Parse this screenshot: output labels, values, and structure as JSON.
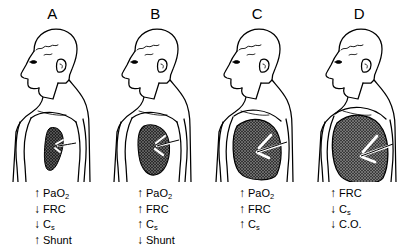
{
  "figure": {
    "background_color": "#ffffff",
    "ink_color": "#000000",
    "lung_fill_color": "#4a4a4a"
  },
  "panels": [
    {
      "letter": "A",
      "lung_state": "collapsed-atelectatic-lung",
      "lung_size": "smallest",
      "stats": [
        {
          "arrow": "↑",
          "direction": "up",
          "label": "PaO",
          "sub": "2",
          "text": "PaO2"
        },
        {
          "arrow": "↓",
          "direction": "down",
          "label": "FRC",
          "sub": "",
          "text": "FRC"
        },
        {
          "arrow": "↓",
          "direction": "down",
          "label": "C",
          "sub": "s",
          "text": "Cs"
        },
        {
          "arrow": "↑",
          "direction": "up",
          "label": "Shunt",
          "sub": "",
          "text": "Shunt"
        }
      ]
    },
    {
      "letter": "B",
      "lung_state": "partially-inflated-lung",
      "lung_size": "small",
      "stats": [
        {
          "arrow": "↑",
          "direction": "up",
          "label": "PaO",
          "sub": "2",
          "text": "PaO2"
        },
        {
          "arrow": "↑",
          "direction": "up",
          "label": "FRC",
          "sub": "",
          "text": "FRC"
        },
        {
          "arrow": "↑",
          "direction": "up",
          "label": "C",
          "sub": "s",
          "text": "Cs"
        },
        {
          "arrow": "↓",
          "direction": "down",
          "label": "Shunt",
          "sub": "",
          "text": "Shunt"
        }
      ]
    },
    {
      "letter": "C",
      "lung_state": "normally-inflated-lung",
      "lung_size": "large",
      "stats": [
        {
          "arrow": "↑",
          "direction": "up",
          "label": "PaO",
          "sub": "2",
          "text": "PaO2"
        },
        {
          "arrow": "↑",
          "direction": "up",
          "label": "FRC",
          "sub": "",
          "text": "FRC"
        },
        {
          "arrow": "↑",
          "direction": "up",
          "label": "C",
          "sub": "s",
          "text": "Cs"
        }
      ]
    },
    {
      "letter": "D",
      "lung_state": "hyperinflated-lung",
      "lung_size": "largest",
      "stats": [
        {
          "arrow": "↑",
          "direction": "up",
          "label": "FRC",
          "sub": "",
          "text": "FRC"
        },
        {
          "arrow": "↓",
          "direction": "down",
          "label": "C",
          "sub": "s",
          "text": "Cs"
        },
        {
          "arrow": "↓",
          "direction": "down",
          "label": "C.O.",
          "sub": "",
          "text": "C.O."
        }
      ]
    }
  ]
}
